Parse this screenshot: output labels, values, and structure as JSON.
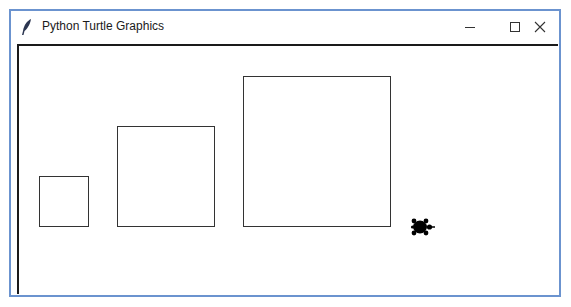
{
  "window": {
    "title": "Python Turtle Graphics",
    "app_icon": "feather-icon",
    "controls": {
      "minimize": "minimize-icon",
      "maximize": "maximize-icon",
      "close": "close-icon"
    },
    "border_color": "#6b93cf"
  },
  "canvas": {
    "background": "#ffffff",
    "squares": [
      {
        "label": "small-square",
        "size": 49
      },
      {
        "label": "medium-square",
        "size": 97
      },
      {
        "label": "large-square",
        "size": 147
      }
    ],
    "turtle": {
      "shape": "turtle",
      "heading": "east",
      "color": "#000000"
    }
  }
}
